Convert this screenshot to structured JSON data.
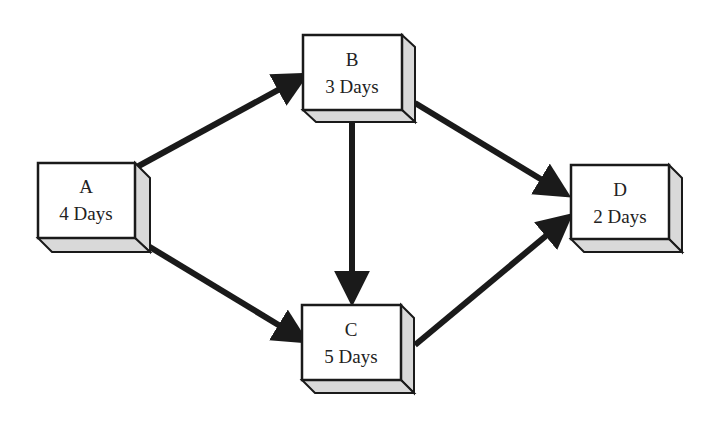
{
  "diagram": {
    "type": "network-dependency",
    "nodes": [
      {
        "id": "A",
        "name": "A",
        "duration": "4 Days"
      },
      {
        "id": "B",
        "name": "B",
        "duration": "3 Days"
      },
      {
        "id": "C",
        "name": "C",
        "duration": "5 Days"
      },
      {
        "id": "D",
        "name": "D",
        "duration": "2 Days"
      }
    ],
    "edges": [
      {
        "from": "A",
        "to": "B"
      },
      {
        "from": "A",
        "to": "C"
      },
      {
        "from": "B",
        "to": "C"
      },
      {
        "from": "B",
        "to": "D"
      },
      {
        "from": "C",
        "to": "D"
      }
    ],
    "colors": {
      "box_face": "#ffffff",
      "box_side": "#d9d9d9",
      "outline": "#1a1a1a",
      "arrow": "#1a1a1a"
    }
  }
}
